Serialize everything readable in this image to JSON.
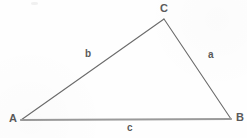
{
  "figure": {
    "background_color": "#fefefe",
    "width": 247,
    "height": 138,
    "stroke_color_thin": "#6b6b6b",
    "stroke_color_base": "#9a9a9a",
    "label_color": "#5a5a5a"
  },
  "vertices": [
    {
      "id": "A",
      "label": "A",
      "x": 21,
      "y": 120
    },
    {
      "id": "B",
      "label": "B",
      "x": 231,
      "y": 119
    },
    {
      "id": "C",
      "label": "C",
      "x": 164,
      "y": 19
    }
  ],
  "sides": [
    {
      "id": "a",
      "label": "a",
      "from": "C",
      "to": "B",
      "x1": 164,
      "y1": 19,
      "x2": 231,
      "y2": 119,
      "stroke_width": 1.1
    },
    {
      "id": "b",
      "label": "b",
      "from": "A",
      "to": "C",
      "x1": 21,
      "y1": 120,
      "x2": 164,
      "y2": 19,
      "stroke_width": 1.1
    },
    {
      "id": "c",
      "label": "c",
      "from": "A",
      "to": "B",
      "x1": 21,
      "y1": 120,
      "x2": 231,
      "y2": 119,
      "stroke_width": 2.1
    }
  ],
  "artifacts": {
    "smudge_present": true
  }
}
